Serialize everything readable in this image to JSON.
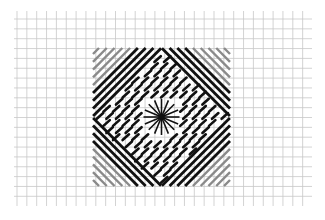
{
  "diagram": {
    "title": "Needlepoint stitch chart",
    "grid": {
      "columns": 30,
      "rows": 20,
      "line_color": "#c8c8c8"
    },
    "block": {
      "size_cells": 14,
      "regions": [
        {
          "name": "top-left corner",
          "stitch": "long diagonal",
          "direction": "/",
          "outer_rows": 5,
          "inner_rows": 4
        },
        {
          "name": "top-right corner",
          "stitch": "long diagonal",
          "direction": "\\",
          "outer_rows": 5,
          "inner_rows": 4
        },
        {
          "name": "bottom-left corner",
          "stitch": "long diagonal",
          "direction": "\\",
          "outer_rows": 5,
          "inner_rows": 4
        },
        {
          "name": "bottom-right corner",
          "stitch": "long diagonal",
          "direction": "/",
          "outer_rows": 5,
          "inner_rows": 4
        },
        {
          "name": "top triangle",
          "stitch": "tent",
          "direction": "/"
        },
        {
          "name": "bottom triangle",
          "stitch": "tent",
          "direction": "/"
        },
        {
          "name": "left triangle",
          "stitch": "tent",
          "direction": "/"
        },
        {
          "name": "right triangle",
          "stitch": "tent",
          "direction": "/"
        }
      ],
      "center": {
        "stitch": "star eyelet",
        "rays": 16
      }
    },
    "colors": {
      "outer_stitch": "#8a8a8a",
      "inner_stitch": "#111111",
      "tent_stitch": "#111111",
      "star": "#111111"
    }
  }
}
